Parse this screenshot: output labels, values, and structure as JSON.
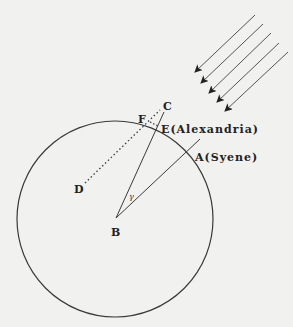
{
  "diagram": {
    "title": "",
    "labels": {
      "A": "A(Syene)",
      "B": "B",
      "C": "C",
      "D": "D",
      "E": "E(Alexandria)",
      "F": "F",
      "gamma": "γ"
    },
    "colors": {
      "background": "#f1f1f0",
      "stroke": "#3a3a3a"
    },
    "sun_rays_count": 5
  }
}
